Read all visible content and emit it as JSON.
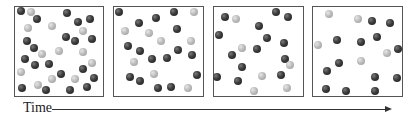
{
  "diagram": {
    "axis": {
      "label": "Time",
      "direction": "left-to-right"
    },
    "colors": {
      "dark_particle": "#2e2e2e",
      "light_particle": "#b4b4b4",
      "border": "#555555"
    },
    "panels": [
      {
        "name": "panel-1",
        "box": {
          "x": 14,
          "y": 6,
          "w": 90,
          "h": 91
        },
        "dark_count": 20,
        "light_count": 12,
        "dark": [
          [
            21,
            11
          ],
          [
            37,
            19
          ],
          [
            67,
            13
          ],
          [
            78,
            22
          ],
          [
            90,
            19
          ],
          [
            27,
            41
          ],
          [
            66,
            37
          ],
          [
            75,
            41
          ],
          [
            92,
            39
          ],
          [
            34,
            48
          ],
          [
            25,
            59
          ],
          [
            35,
            65
          ],
          [
            49,
            64
          ],
          [
            61,
            74
          ],
          [
            83,
            69
          ],
          [
            94,
            78
          ],
          [
            22,
            88
          ],
          [
            46,
            90
          ],
          [
            70,
            90
          ],
          [
            87,
            87
          ]
        ],
        "light": [
          [
            31,
            12
          ],
          [
            28,
            28
          ],
          [
            52,
            26
          ],
          [
            83,
            31
          ],
          [
            42,
            54
          ],
          [
            59,
            51
          ],
          [
            83,
            52
          ],
          [
            92,
            63
          ],
          [
            21,
            72
          ],
          [
            52,
            79
          ],
          [
            75,
            79
          ],
          [
            38,
            85
          ]
        ]
      },
      {
        "name": "panel-2",
        "box": {
          "x": 113,
          "y": 6,
          "w": 91,
          "h": 91
        },
        "dark_count": 16,
        "light_count": 8,
        "dark": [
          [
            119,
            12
          ],
          [
            156,
            18
          ],
          [
            174,
            12
          ],
          [
            139,
            23
          ],
          [
            177,
            29
          ],
          [
            128,
            46
          ],
          [
            140,
            51
          ],
          [
            152,
            59
          ],
          [
            167,
            58
          ],
          [
            178,
            50
          ],
          [
            192,
            55
          ],
          [
            197,
            75
          ],
          [
            130,
            77
          ],
          [
            140,
            81
          ],
          [
            158,
            88
          ],
          [
            171,
            87
          ]
        ],
        "light": [
          [
            194,
            12
          ],
          [
            125,
            31
          ],
          [
            149,
            33
          ],
          [
            161,
            41
          ],
          [
            191,
            41
          ],
          [
            134,
            62
          ],
          [
            154,
            74
          ],
          [
            188,
            88
          ]
        ]
      },
      {
        "name": "panel-3",
        "box": {
          "x": 213,
          "y": 6,
          "w": 91,
          "h": 91
        },
        "dark_count": 14,
        "light_count": 6,
        "dark": [
          [
            225,
            17
          ],
          [
            276,
            12
          ],
          [
            288,
            17
          ],
          [
            259,
            26
          ],
          [
            219,
            35
          ],
          [
            267,
            38
          ],
          [
            284,
            43
          ],
          [
            257,
            49
          ],
          [
            232,
            55
          ],
          [
            285,
            59
          ],
          [
            242,
            67
          ],
          [
            281,
            75
          ],
          [
            217,
            77
          ],
          [
            238,
            81
          ]
        ],
        "light": [
          [
            236,
            19
          ],
          [
            242,
            48
          ],
          [
            290,
            65
          ],
          [
            262,
            76
          ],
          [
            254,
            91
          ],
          [
            287,
            88
          ]
        ]
      },
      {
        "name": "panel-4",
        "box": {
          "x": 312,
          "y": 6,
          "w": 91,
          "h": 91
        },
        "dark_count": 13,
        "light_count": 5,
        "dark": [
          [
            372,
            21
          ],
          [
            390,
            23
          ],
          [
            337,
            40
          ],
          [
            361,
            42
          ],
          [
            377,
            37
          ],
          [
            398,
            49
          ],
          [
            339,
            63
          ],
          [
            327,
            71
          ],
          [
            375,
            77
          ],
          [
            397,
            78
          ],
          [
            326,
            89
          ],
          [
            346,
            91
          ],
          [
            375,
            91
          ]
        ],
        "light": [
          [
            329,
            14
          ],
          [
            358,
            19
          ],
          [
            318,
            45
          ],
          [
            387,
            53
          ],
          [
            361,
            61
          ]
        ]
      }
    ]
  }
}
